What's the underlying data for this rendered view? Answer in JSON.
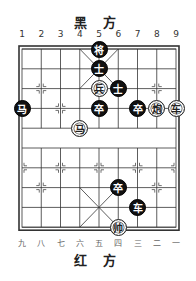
{
  "top_label": "黑 方",
  "bottom_label": "红 方",
  "top_file_numbers": [
    "1",
    "2",
    "3",
    "4",
    "5",
    "6",
    "7",
    "8",
    "9"
  ],
  "bottom_file_numbers": [
    "九",
    "八",
    "七",
    "六",
    "五",
    "四",
    "三",
    "二",
    "一"
  ],
  "board": {
    "files": 9,
    "ranks": 10,
    "line_color": "#333333",
    "pieces": [
      {
        "side": "black",
        "char": "将",
        "col": 5,
        "row": 0
      },
      {
        "side": "black",
        "char": "士",
        "col": 5,
        "row": 1
      },
      {
        "side": "red",
        "char": "兵",
        "col": 5,
        "row": 2
      },
      {
        "side": "black",
        "char": "士",
        "col": 6,
        "row": 2
      },
      {
        "side": "black",
        "char": "马",
        "col": 1,
        "row": 3
      },
      {
        "side": "black",
        "char": "卒",
        "col": 5,
        "row": 3
      },
      {
        "side": "black",
        "char": "卒",
        "col": 7,
        "row": 3
      },
      {
        "side": "red",
        "char": "炮",
        "col": 8,
        "row": 3
      },
      {
        "side": "red",
        "char": "车",
        "col": 9,
        "row": 3
      },
      {
        "side": "red",
        "char": "马",
        "col": 4,
        "row": 4
      },
      {
        "side": "black",
        "char": "卒",
        "col": 6,
        "row": 7
      },
      {
        "side": "black",
        "char": "车",
        "col": 7,
        "row": 8
      },
      {
        "side": "red",
        "char": "帅",
        "col": 6,
        "row": 9
      }
    ]
  }
}
